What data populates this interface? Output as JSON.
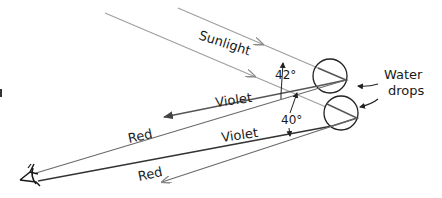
{
  "diagram": {
    "labels": {
      "sunlight": "Sunlight",
      "angle_upper": "42°",
      "angle_lower": "40°",
      "violet_upper": "Violet",
      "violet_lower": "Violet",
      "red_upper": "Red",
      "red_lower": "Red",
      "water_line1": "Water",
      "water_line2": "drops"
    },
    "colors": {
      "sun_ray": "#9a9a9a",
      "ray_dark": "#333333",
      "ray_gray": "#6e6e6e",
      "drop_outline": "#222222",
      "text": "#1a1a1a"
    },
    "elements": {
      "drops": [
        {
          "name": "upper-drop",
          "cx": 330,
          "cy": 76,
          "r": 17
        },
        {
          "name": "lower-drop",
          "cx": 341,
          "cy": 113,
          "r": 17
        }
      ],
      "eye": {
        "x": 22,
        "y": 178
      }
    }
  }
}
